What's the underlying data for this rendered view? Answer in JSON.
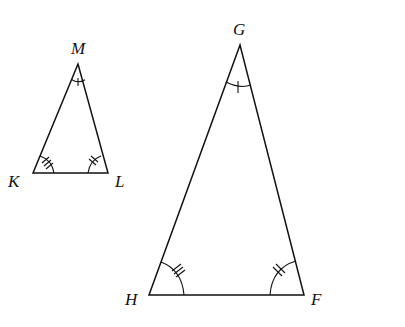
{
  "diagram": {
    "small_triangle": {
      "name": "KLM",
      "vertices": {
        "M": {
          "label": "M",
          "x": 78,
          "y": 64
        },
        "K": {
          "label": "K",
          "x": 33,
          "y": 173
        },
        "L": {
          "label": "L",
          "x": 108,
          "y": 173
        }
      },
      "angle_marks": {
        "M": 1,
        "K": 3,
        "L": 2
      }
    },
    "large_triangle": {
      "name": "GHF",
      "vertices": {
        "G": {
          "label": "G",
          "x": 240,
          "y": 45
        },
        "H": {
          "label": "H",
          "x": 149,
          "y": 295
        },
        "F": {
          "label": "F",
          "x": 304,
          "y": 295
        }
      },
      "angle_marks": {
        "G": 1,
        "H": 3,
        "F": 2
      }
    },
    "colors": {
      "stroke": "#111111",
      "background": "#ffffff"
    }
  }
}
